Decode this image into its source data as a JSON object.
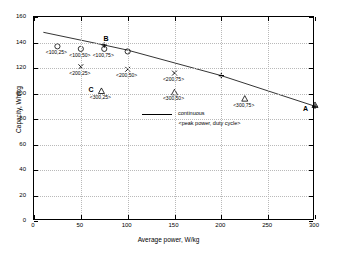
{
  "chart_data": {
    "type": "scatter",
    "title": "",
    "xlabel": "Average power, W/kg",
    "ylabel": "Capacity, Wh/kg",
    "xlim": [
      0,
      300
    ],
    "ylim": [
      0,
      160
    ],
    "xticks": [
      0,
      50,
      100,
      150,
      200,
      250,
      300
    ],
    "yticks": [
      0,
      20,
      40,
      60,
      80,
      100,
      120,
      140,
      160
    ],
    "grid": true,
    "legend": {
      "position": "center-right",
      "entries": [
        {
          "label": "continuous",
          "marker": "line"
        }
      ],
      "subtitle": "<peak power, duty cycle>"
    },
    "series": [
      {
        "name": "continuous",
        "type": "line",
        "marker": "none",
        "points": [
          {
            "x": 10,
            "y": 148
          },
          {
            "x": 75,
            "y": 138
          },
          {
            "x": 100,
            "y": 134
          },
          {
            "x": 200,
            "y": 114
          },
          {
            "x": 300,
            "y": 90
          }
        ]
      },
      {
        "name": "peak power 100 W/kg",
        "type": "scatter",
        "marker": "circle",
        "points": [
          {
            "x": 25,
            "y": 137,
            "label": "<100,25>"
          },
          {
            "x": 50,
            "y": 135,
            "label": "<100,50>"
          },
          {
            "x": 75,
            "y": 135,
            "label": "<100,75>"
          },
          {
            "x": 100,
            "y": 133,
            "label": ""
          }
        ]
      },
      {
        "name": "peak power 200 W/kg",
        "type": "scatter",
        "marker": "cross",
        "points": [
          {
            "x": 50,
            "y": 121,
            "label": "<200,25>"
          },
          {
            "x": 100,
            "y": 119,
            "label": "<200,50>"
          },
          {
            "x": 150,
            "y": 116,
            "label": "<200,75>"
          }
        ]
      },
      {
        "name": "peak power 300 W/kg",
        "type": "scatter",
        "marker": "triangle",
        "points": [
          {
            "x": 72,
            "y": 102,
            "label": "<300,25>"
          },
          {
            "x": 150,
            "y": 101,
            "label": "<300,50>"
          },
          {
            "x": 225,
            "y": 96,
            "label": "<300,75>"
          },
          {
            "x": 300,
            "y": 91,
            "label": ""
          }
        ]
      },
      {
        "name": "continuous markers",
        "type": "scatter",
        "marker": "plus",
        "points": [
          {
            "x": 75,
            "y": 138,
            "label": ""
          },
          {
            "x": 200,
            "y": 114,
            "label": ""
          },
          {
            "x": 300,
            "y": 90,
            "label": ""
          }
        ]
      }
    ],
    "annotations": [
      {
        "text": "B",
        "x": 78,
        "y": 143
      },
      {
        "text": "C",
        "x": 62,
        "y": 103
      },
      {
        "text": "A",
        "x": 291,
        "y": 88
      }
    ]
  }
}
